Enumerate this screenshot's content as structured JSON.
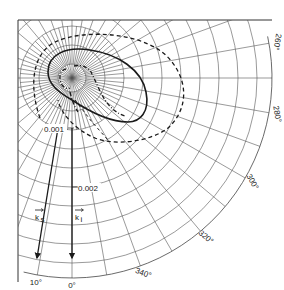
{
  "diagram": {
    "type": "polar-scattering-diagram",
    "center": {
      "x": 72,
      "y": 78
    },
    "angle_labels": [
      {
        "text": "10°",
        "angle": 10
      },
      {
        "text": "0°",
        "angle": 0
      },
      {
        "text": "340°",
        "angle": 340
      },
      {
        "text": "320°",
        "angle": 320
      },
      {
        "text": "300°",
        "angle": 300
      },
      {
        "text": "280°",
        "angle": 280
      },
      {
        "text": "260°",
        "angle": 260
      }
    ],
    "radial_labels": [
      {
        "text": "0.001"
      },
      {
        "text": "0.002"
      }
    ],
    "vectors": [
      {
        "label": "k",
        "subscript": "s",
        "angle": 10
      },
      {
        "label": "k",
        "subscript": "i",
        "angle": 0
      }
    ],
    "curves": [
      {
        "name": "solid-lobe",
        "style": "solid"
      },
      {
        "name": "outer-dashed",
        "style": "dashed"
      },
      {
        "name": "inner-dash-dot",
        "style": "dash-dot"
      }
    ],
    "colors": {
      "ink": "#1a1a1a",
      "grid": "#555555",
      "background": "#ffffff"
    }
  }
}
